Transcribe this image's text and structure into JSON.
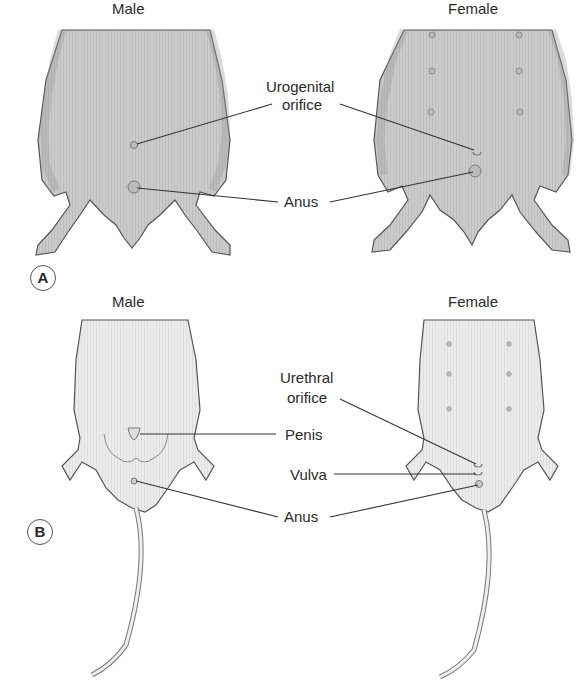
{
  "panel_a": {
    "badge": "A",
    "male_title": "Male",
    "female_title": "Female",
    "labels": {
      "urogenital": "Urogenital\norifice",
      "urogenital_l1": "Urogenital",
      "urogenital_l2": "orifice",
      "anus": "Anus"
    }
  },
  "panel_b": {
    "badge": "B",
    "male_title": "Male",
    "female_title": "Female",
    "labels": {
      "urethral_l1": "Urethral",
      "urethral_l2": "orifice",
      "penis": "Penis",
      "vulva": "Vulva",
      "anus": "Anus"
    }
  },
  "colors": {
    "fur_a": "#c8c8c8",
    "fur_b": "#e9e9e9",
    "outline": "#555555",
    "leader": "#333333"
  }
}
